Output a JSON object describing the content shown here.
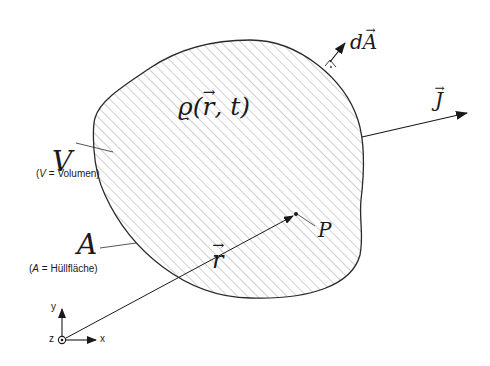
{
  "diagram": {
    "density_label": {
      "prefix": "ϱ(",
      "vec": "r",
      "suffix": ", t)"
    },
    "volume_symbol": "V",
    "volume_caption": {
      "open": "(",
      "sym": "V",
      "rest": " = Volumen)"
    },
    "surface_symbol": "A",
    "surface_caption": {
      "open": "(",
      "sym": "A",
      "rest": " = Hüllfläche)"
    },
    "area_element": {
      "d": "d",
      "vec": "A"
    },
    "current_density": {
      "vec": "J"
    },
    "position_vector": {
      "vec": "r"
    },
    "point_label": "P",
    "axes": {
      "x": "x",
      "y": "y",
      "z": "z"
    },
    "colors": {
      "stroke": "#2a2a2a",
      "hatch": "#8a8a8a",
      "background": "#ffffff"
    }
  }
}
